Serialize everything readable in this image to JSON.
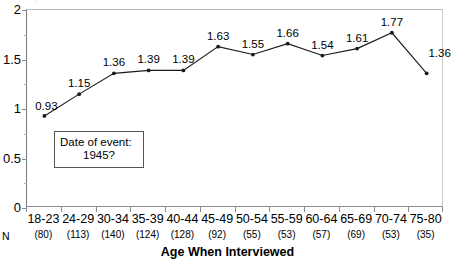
{
  "chart_data": {
    "type": "line",
    "title": "",
    "xlabel": "Age When Interviewed",
    "ylabel": "",
    "categories": [
      "18-23",
      "24-29",
      "30-34",
      "35-39",
      "40-44",
      "45-49",
      "50-54",
      "55-59",
      "60-64",
      "65-69",
      "70-74",
      "75-80"
    ],
    "values": [
      0.93,
      1.15,
      1.36,
      1.39,
      1.39,
      1.63,
      1.55,
      1.66,
      1.54,
      1.61,
      1.77,
      1.36
    ],
    "point_labels": [
      "0.93",
      "1.15",
      "1.36",
      "1.39",
      "1.39",
      "1.63",
      "1.55",
      "1.66",
      "1.54",
      "1.61",
      "1.77",
      "1.36"
    ],
    "n_label": "N",
    "n_values": [
      "(80)",
      "(113)",
      "(140)",
      "(124)",
      "(128)",
      "(92)",
      "(55)",
      "(53)",
      "(57)",
      "(69)",
      "(53)",
      "(35)"
    ],
    "ylim": [
      0,
      2
    ],
    "ytick_labels": [
      "0",
      "0.5",
      "1",
      "1.5",
      "2"
    ],
    "ytick_values": [
      0,
      0.5,
      1,
      1.5,
      2
    ],
    "yminor_values": [
      0.25,
      0.75,
      1.25,
      1.75
    ],
    "grid": false,
    "legend": "none",
    "marker": "filled-circle",
    "line_color": "#1a1a1a",
    "marker_color": "#1a1a1a",
    "axis_color": "#8a8a8a",
    "annotation": {
      "line1": "Date of event:",
      "line2": "1945?"
    },
    "clipped_top_text": "."
  }
}
